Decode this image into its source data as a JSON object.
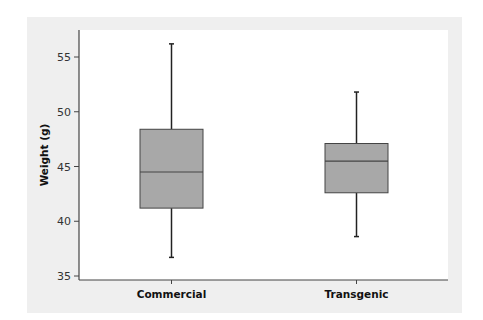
{
  "chart_data": {
    "type": "box",
    "title": "",
    "xlabel": "",
    "ylabel": "Weight (g)",
    "ylim": [
      34.6,
      57.5
    ],
    "yticks": [
      35,
      40,
      45,
      50,
      55
    ],
    "grid": false,
    "categories": [
      "Commercial",
      "Transgenic"
    ],
    "boxes": [
      {
        "name": "Commercial",
        "whisker_low": 36.7,
        "q1": 41.2,
        "median": 44.5,
        "q3": 48.4,
        "whisker_high": 56.2
      },
      {
        "name": "Transgenic",
        "whisker_low": 38.6,
        "q1": 42.6,
        "median": 45.5,
        "q3": 47.1,
        "whisker_high": 51.8
      }
    ],
    "colors": {
      "box_fill": "#a8a8a8",
      "box_stroke": "#444444",
      "panel_bg": "#efefef",
      "plot_bg": "#ffffff",
      "axis": "#444444"
    }
  }
}
